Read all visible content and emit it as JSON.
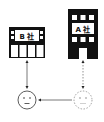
{
  "diagram": {
    "buildings": [
      {
        "id": "company-b",
        "label": "B 社",
        "style": "wide-low"
      },
      {
        "id": "company-a",
        "label": "A 社",
        "style": "tall-with-door"
      }
    ],
    "people": [
      {
        "id": "person-left",
        "style": "solid",
        "expression": "neutral"
      },
      {
        "id": "person-right",
        "style": "dotted",
        "expression": "neutral"
      }
    ],
    "connections": [
      {
        "from": "company-b",
        "to": "person-left",
        "style": "solid",
        "arrowheads": "both"
      },
      {
        "from": "company-a",
        "to": "person-right",
        "style": "dotted",
        "arrowheads": "both"
      },
      {
        "from": "person-right",
        "to": "person-left",
        "style": "solid",
        "arrowheads": "end"
      }
    ],
    "colors": {
      "building": "#111111",
      "window": "#ffffff",
      "line_solid": "#555555",
      "line_dotted": "#777777",
      "face_solid": "#333333",
      "face_dotted": "#888888"
    }
  }
}
